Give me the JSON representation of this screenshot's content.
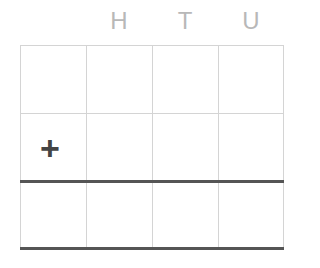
{
  "headers": {
    "hundreds": "H",
    "tens": "T",
    "units": "U"
  },
  "operator": "+"
}
